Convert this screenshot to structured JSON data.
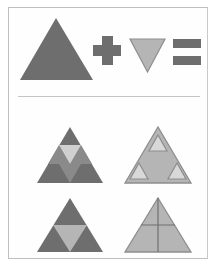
{
  "puzzle": {
    "type": "visual-analogy-multiple-choice",
    "question_label": "",
    "equation": {
      "operand_1": "large-gray-triangle-up",
      "operator_1": "plus",
      "operand_2": "small-light-triangle-down",
      "operator_2": "equals",
      "result": "unknown"
    }
  },
  "colors": {
    "page_background": "#ffffff",
    "frame_border": "#bfbfbf",
    "divider": "#c4c4c4",
    "dark_gray": "#6e6e6e",
    "medium_gray": "#8a8a8a",
    "light_gray": "#b5b5b5",
    "pale_gray": "#c9c9c9",
    "outline_gray": "#8d8d8d",
    "highlight": "#d8d8d8"
  },
  "prompt_row": {
    "shapes": [
      {
        "name": "triangle-up-large",
        "fill": "#6e6e6e",
        "points": "56,18 93,80 20,80"
      },
      {
        "name": "plus-operator",
        "fill": "#6e6e6e",
        "bars": [
          {
            "x": 93,
            "y": 45,
            "w": 28,
            "h": 11
          },
          {
            "x": 102,
            "y": 36,
            "w": 11,
            "h": 29
          }
        ]
      },
      {
        "name": "triangle-down-small",
        "fill": "#b5b5b5",
        "stroke": "#8d8d8d",
        "points": "130,39 165,39 147.5,72"
      },
      {
        "name": "equals-operator",
        "fill": "#6e6e6e",
        "bars": [
          {
            "x": 173,
            "y": 39,
            "w": 28,
            "h": 9
          },
          {
            "x": 173,
            "y": 56,
            "w": 28,
            "h": 9
          }
        ]
      }
    ]
  },
  "answer_options": [
    {
      "id": "A",
      "name": "option-a-triangle-with-center-band",
      "position": "top-left",
      "description": "Dark triangle containing a row of three small triangles near the middle, the central one inverted and light.",
      "outer_fill": "#6e6e6e",
      "inner_light_fill": "#d0d0d0",
      "inner_medium_fill": "#8a8a8a"
    },
    {
      "id": "B",
      "name": "option-b-triangle-with-three-small-triangles",
      "position": "top-right",
      "description": "Light gray triangle with three small outlined pale triangles at apex and both lower corners.",
      "outer_fill": "#b5b5b5",
      "outer_stroke": "#8d8d8d",
      "inner_fill": "#d8d8d8",
      "inner_stroke": "#8d8d8d"
    },
    {
      "id": "C",
      "name": "option-c-triangle-with-inverted-light-triangle",
      "position": "bottom-left",
      "description": "Dark triangle with one large light inverted triangle occupying the lower middle.",
      "outer_fill": "#6e6e6e",
      "inner_fill": "#b5b5b5"
    },
    {
      "id": "D",
      "name": "option-d-triangle-with-cross-lines",
      "position": "bottom-right",
      "description": "Light gray triangle divided by one vertical and one horizontal line.",
      "outer_fill": "#b5b5b5",
      "outer_stroke": "#8d8d8d",
      "line_stroke": "#6f6f6f"
    }
  ]
}
